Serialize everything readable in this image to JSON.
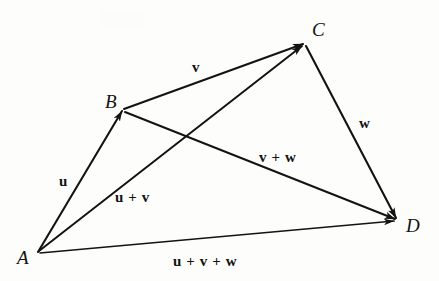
{
  "figure": {
    "width": 439,
    "height": 281,
    "background_color": "#fdfdfc",
    "stroke_color": "#131313"
  },
  "vertices": [
    {
      "id": "A",
      "label": "A",
      "x": 38,
      "y": 252,
      "label_x": 17,
      "label_y": 248
    },
    {
      "id": "B",
      "label": "B",
      "x": 123,
      "y": 110,
      "label_x": 105,
      "label_y": 92
    },
    {
      "id": "C",
      "label": "C",
      "x": 304,
      "y": 43,
      "label_x": 312,
      "label_y": 20
    },
    {
      "id": "D",
      "label": "D",
      "x": 397,
      "y": 220,
      "label_x": 406,
      "label_y": 216
    }
  ],
  "vectors": [
    {
      "id": "u",
      "label": "u",
      "from": "A",
      "to": "B",
      "label_x": 59,
      "label_y": 174
    },
    {
      "id": "v",
      "label": "v",
      "from": "B",
      "to": "C",
      "label_x": 192,
      "label_y": 60
    },
    {
      "id": "w",
      "label": "w",
      "from": "C",
      "to": "D",
      "label_x": 359,
      "label_y": 116
    },
    {
      "id": "uv",
      "label": "u + v",
      "from": "A",
      "to": "C",
      "label_x": 115,
      "label_y": 190
    },
    {
      "id": "vw",
      "label": "v + w",
      "from": "B",
      "to": "D",
      "label_x": 259,
      "label_y": 150
    },
    {
      "id": "uvw",
      "label": "u + v + w",
      "from": "A",
      "to": "D",
      "label_x": 173,
      "label_y": 254
    }
  ]
}
